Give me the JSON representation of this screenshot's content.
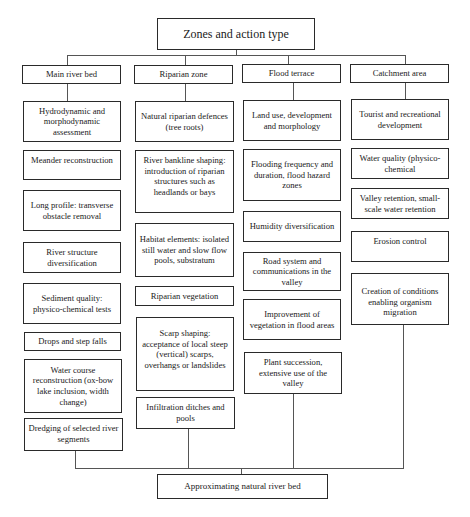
{
  "title": "Zones and action type",
  "zones": [
    {
      "label": "Main river bed",
      "actions": [
        "Hydrodynamic and morphodynamic assessment",
        "Meander reconstruction",
        "Long profile: transverse obstacle removal",
        "River structure diversification",
        "Sediment quality: physico-chemical tests",
        "Drops and step falls",
        "Water course reconstruction (ox-bow lake inclusion, width change)",
        "Dredging of selected river segments"
      ]
    },
    {
      "label": "Riparian zone",
      "actions": [
        "Natural riparian defences (tree roots)",
        "River bankline shaping: introduction of riparian structures such as headlands or bays",
        "Habitat elements: isolated still water and slow flow pools, substratum",
        "Riparian vegetation",
        "Scarp shaping: acceptance of local steep (vertical) scarps, overhangs or  landslides",
        "Infiltration ditches and pools"
      ]
    },
    {
      "label": "Flood terrace",
      "actions": [
        "Land use, development and morphology",
        "Flooding frequency and duration, flood hazard zones",
        "Humidity diversification",
        "Road system and communications in the valley",
        "Improvement of vegetation in flood areas",
        "Plant succession, extensive use of the valley"
      ]
    },
    {
      "label": "Catchment area",
      "actions": [
        "Tourist  and recreational development",
        "Water quality (physico-chemical",
        "Valley retention, small-scale water retention",
        "Erosion control",
        "Creation of conditions enabling organism migration"
      ]
    }
  ],
  "outcome": "Approximating natural river bed"
}
